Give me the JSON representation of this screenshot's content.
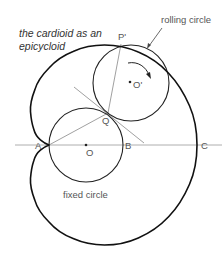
{
  "figure": {
    "title_line1": "the cardioid as an",
    "title_line2": "epicycloid",
    "labels": {
      "rolling_circle": "rolling circle",
      "fixed_circle": "fixed circle"
    },
    "points": {
      "A": "A",
      "B": "B",
      "C": "C",
      "O": "O",
      "O_prime": "O'",
      "P_prime": "P'",
      "Q": "Q"
    },
    "colors": {
      "curve": "#111111",
      "construction_line": "#888888",
      "text": "#555555"
    }
  }
}
